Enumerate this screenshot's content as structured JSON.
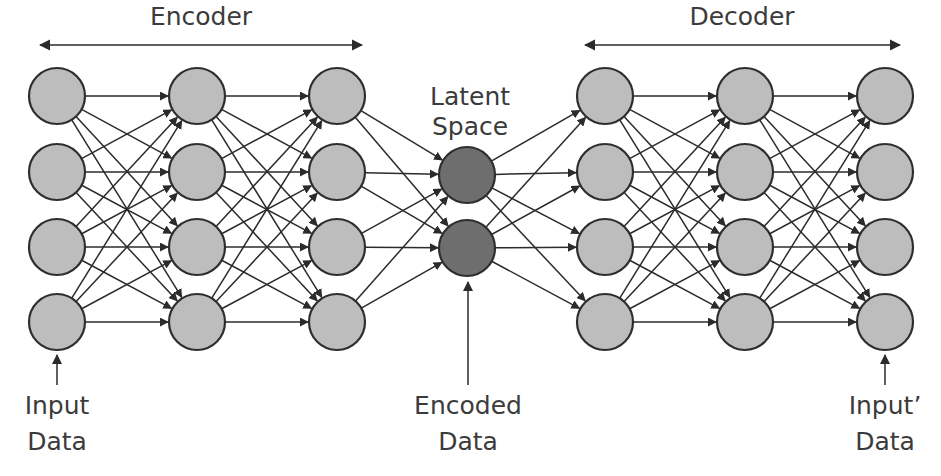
{
  "diagram": {
    "type": "neural-network-architecture",
    "background_color": "#ffffff",
    "stroke_color": "#2b2b2b",
    "text_color": "#3b3b3b",
    "node_fill_light": "#bdbdbd",
    "node_fill_dark": "#6e6e6e",
    "node_stroke": "#2e2e2e",
    "node_radius": 28,
    "latent_node_radius": 28
  },
  "spans": [
    {
      "id": "encoder-span",
      "label": "Encoder",
      "x1": 40,
      "x2": 362,
      "y": 45,
      "label_x": 201,
      "label_y": 18
    },
    {
      "id": "decoder-span",
      "label": "Decoder",
      "x1": 585,
      "x2": 900,
      "y": 45,
      "label_x": 742,
      "label_y": 18
    }
  ],
  "layers": [
    {
      "id": "input-layer",
      "name": "Input Layer",
      "x": 57,
      "node_count": 4,
      "fill": "#bdbdbd",
      "node_y": [
        96,
        172,
        247,
        322
      ]
    },
    {
      "id": "encoder-hidden-1",
      "name": "Encoder Hidden Layer 1",
      "x": 197,
      "node_count": 4,
      "fill": "#bdbdbd",
      "node_y": [
        96,
        172,
        247,
        322
      ]
    },
    {
      "id": "encoder-hidden-2",
      "name": "Encoder Hidden Layer 2",
      "x": 337,
      "node_count": 4,
      "fill": "#bdbdbd",
      "node_y": [
        96,
        172,
        247,
        322
      ]
    },
    {
      "id": "latent-layer",
      "name": "Latent Space Layer",
      "x": 467,
      "node_count": 2,
      "fill": "#6e6e6e",
      "node_y": [
        175,
        248
      ]
    },
    {
      "id": "decoder-hidden-1",
      "name": "Decoder Hidden Layer 1",
      "x": 605,
      "node_count": 4,
      "fill": "#bdbdbd",
      "node_y": [
        96,
        172,
        247,
        322
      ]
    },
    {
      "id": "decoder-hidden-2",
      "name": "Decoder Hidden Layer 2",
      "x": 745,
      "node_count": 4,
      "fill": "#bdbdbd",
      "node_y": [
        96,
        172,
        247,
        322
      ]
    },
    {
      "id": "output-layer",
      "name": "Output Layer",
      "x": 885,
      "node_count": 4,
      "fill": "#bdbdbd",
      "node_y": [
        96,
        172,
        247,
        322
      ]
    }
  ],
  "connections": [
    {
      "from": "input-layer",
      "to": "encoder-hidden-1",
      "style": "fully-connected"
    },
    {
      "from": "encoder-hidden-1",
      "to": "encoder-hidden-2",
      "style": "fully-connected"
    },
    {
      "from": "encoder-hidden-2",
      "to": "latent-layer",
      "style": "fully-connected"
    },
    {
      "from": "latent-layer",
      "to": "decoder-hidden-1",
      "style": "fully-connected"
    },
    {
      "from": "decoder-hidden-1",
      "to": "decoder-hidden-2",
      "style": "fully-connected"
    },
    {
      "from": "decoder-hidden-2",
      "to": "output-layer",
      "style": "fully-connected"
    }
  ],
  "annotations": {
    "latent_space": {
      "id": "latent-space-label",
      "line1": "Latent",
      "line2": "Space",
      "x": 470,
      "y1": 98,
      "y2": 128
    },
    "callouts": [
      {
        "id": "input-data-callout",
        "line1": "Input",
        "line2": "Data",
        "text_x": 57,
        "text_y1": 407,
        "text_y2": 443,
        "arrow_x": 57,
        "arrow_y_start": 385,
        "arrow_y_end": 355
      },
      {
        "id": "encoded-data-callout",
        "line1": "Encoded",
        "line2": "Data",
        "text_x": 468,
        "text_y1": 407,
        "text_y2": 443,
        "arrow_x": 468,
        "arrow_y_start": 385,
        "arrow_y_end": 282
      },
      {
        "id": "input-prime-data-callout",
        "line1": "Input’",
        "line2": "Data",
        "text_x": 885,
        "text_y1": 407,
        "text_y2": 443,
        "arrow_x": 885,
        "arrow_y_start": 385,
        "arrow_y_end": 355
      }
    ]
  }
}
